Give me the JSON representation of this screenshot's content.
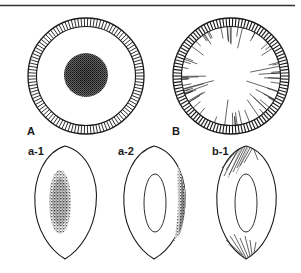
{
  "figure": {
    "top_rule": true,
    "panels": [
      {
        "id": "A",
        "label": "A",
        "type": "cross-section",
        "feature": "central dense stippled core"
      },
      {
        "id": "B",
        "label": "B",
        "type": "cross-section",
        "feature": "radial streaks from periphery"
      },
      {
        "id": "a-1",
        "label": "a-1",
        "type": "lens",
        "feature": "central stippled elongated core"
      },
      {
        "id": "a-2",
        "label": "a-2",
        "type": "lens",
        "feature": "inner ellipse with stippling along right edge"
      },
      {
        "id": "b-1",
        "label": "b-1",
        "type": "lens",
        "feature": "inner ellipse with streaks at top and bottom tips"
      }
    ]
  },
  "colors": {
    "line": "#1a1a1a",
    "stipple": "#333333",
    "background": "#ffffff"
  }
}
